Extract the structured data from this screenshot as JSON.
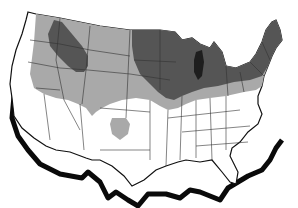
{
  "figure": {
    "type": "choropleth-map",
    "region": "Contiguous United States",
    "background": "#ffffff",
    "colors": {
      "outline": "#111111",
      "shadow": "#0a0a0a",
      "state_border": "#333333",
      "unshaded": "#ffffff",
      "light_zone": "#a9a9a9",
      "dark_zone": "#555555",
      "darkest_zone": "#3a3a3a"
    },
    "zones": [
      {
        "name": "northern-light-band",
        "shade": "light"
      },
      {
        "name": "northern-plains-dark-zone",
        "shade": "dark"
      },
      {
        "name": "upper-midwest-dark-zone",
        "shade": "dark"
      },
      {
        "name": "northeast-dark-zone",
        "shade": "dark"
      },
      {
        "name": "oklahoma-panhandle-light-spot",
        "shade": "light"
      }
    ]
  }
}
